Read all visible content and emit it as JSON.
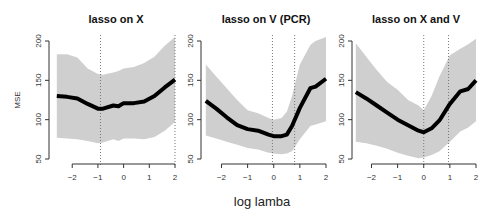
{
  "chart_data": [
    {
      "type": "line",
      "title": "lasso on X",
      "xlabel": "log lamba",
      "ylabel": "MSE",
      "xlim": [
        -2.6,
        2.05
      ],
      "ylim": [
        50,
        200
      ],
      "xticks": [
        -2,
        -1,
        0,
        1,
        2
      ],
      "yticks": [
        50,
        100,
        150,
        200
      ],
      "vlines": [
        -0.9,
        2.0
      ],
      "x": [
        -2.6,
        -2.2,
        -1.8,
        -1.4,
        -1.0,
        -0.8,
        -0.4,
        -0.2,
        0,
        0.4,
        0.8,
        1.2,
        1.6,
        2.0
      ],
      "mean": [
        130,
        129,
        127,
        120,
        114,
        114,
        118,
        117,
        121,
        121,
        123,
        130,
        141,
        151
      ],
      "upper": [
        183,
        183,
        179,
        165,
        158,
        157,
        160,
        162,
        165,
        167,
        172,
        180,
        194,
        205
      ],
      "lower": [
        77,
        76,
        75,
        73,
        70,
        71,
        75,
        73,
        76,
        76,
        75,
        78,
        86,
        97
      ]
    },
    {
      "type": "line",
      "title": "lasso on V (PCR)",
      "xlabel": "log lamba",
      "ylabel": "",
      "xlim": [
        -2.6,
        2.05
      ],
      "ylim": [
        50,
        200
      ],
      "xticks": [
        -2,
        -1,
        0,
        1,
        2
      ],
      "yticks": [
        50,
        100,
        150,
        200
      ],
      "vlines": [
        -0.05,
        0.8
      ],
      "x": [
        -2.6,
        -2.2,
        -1.8,
        -1.4,
        -1.0,
        -0.6,
        -0.2,
        0,
        0.3,
        0.5,
        0.7,
        1.0,
        1.4,
        1.6,
        2.0
      ],
      "mean": [
        124,
        114,
        103,
        93,
        88,
        86,
        81,
        79,
        79,
        81,
        92,
        115,
        140,
        142,
        152
      ],
      "upper": [
        170,
        155,
        140,
        125,
        112,
        108,
        102,
        100,
        102,
        110,
        130,
        170,
        195,
        200,
        205
      ],
      "lower": [
        80,
        76,
        72,
        68,
        64,
        62,
        58,
        57,
        56,
        57,
        60,
        75,
        92,
        94,
        98
      ]
    },
    {
      "type": "line",
      "title": "lasso on X and V",
      "xlabel": "log lamba",
      "ylabel": "",
      "xlim": [
        -2.6,
        2.05
      ],
      "ylim": [
        50,
        200
      ],
      "xticks": [
        -2,
        -1,
        0,
        1,
        2
      ],
      "yticks": [
        50,
        100,
        150,
        200
      ],
      "vlines": [
        0.0,
        0.95
      ],
      "x": [
        -2.6,
        -2.2,
        -1.8,
        -1.4,
        -1.0,
        -0.6,
        -0.2,
        0,
        0.3,
        0.6,
        1.0,
        1.4,
        1.7,
        2.0
      ],
      "mean": [
        135,
        127,
        118,
        109,
        100,
        93,
        86,
        84,
        89,
        99,
        120,
        136,
        139,
        150
      ],
      "upper": [
        197,
        180,
        163,
        148,
        138,
        125,
        118,
        112,
        130,
        155,
        182,
        190,
        196,
        203
      ],
      "lower": [
        72,
        70,
        67,
        63,
        58,
        54,
        51,
        52,
        55,
        60,
        72,
        85,
        90,
        98
      ]
    }
  ],
  "labels": {
    "shared_xlabel": "log lamba",
    "ylabel": "MSE"
  }
}
